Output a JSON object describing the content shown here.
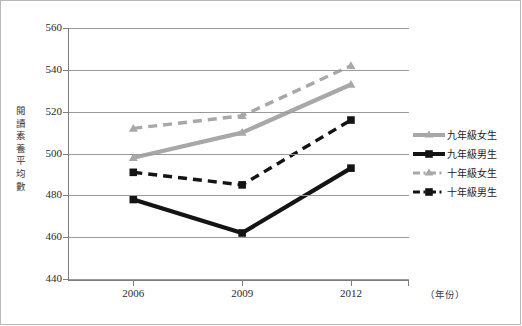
{
  "chart_data": {
    "type": "line",
    "title": "",
    "subtitle": "",
    "xlabel": "（年份）",
    "ylabel": "閱讀素養平均數",
    "categories": [
      "2006",
      "2009",
      "2012"
    ],
    "x": [
      2006,
      2009,
      2012
    ],
    "xlim": [
      2004.2,
      2013.6
    ],
    "ylim": [
      440,
      560
    ],
    "yticks": [
      440,
      460,
      480,
      500,
      520,
      540,
      560
    ],
    "grid": "horizontal",
    "legend_position": "right",
    "series": [
      {
        "name": "九年級女生",
        "values": [
          498,
          510,
          533
        ],
        "color": "#a8a8a8",
        "style": "solid",
        "marker": "triangle"
      },
      {
        "name": "九年級男生",
        "values": [
          478,
          462,
          493
        ],
        "color": "#141414",
        "style": "solid",
        "marker": "square"
      },
      {
        "name": "十年級女生",
        "values": [
          512,
          518,
          542
        ],
        "color": "#a8a8a8",
        "style": "dashed",
        "marker": "triangle"
      },
      {
        "name": "十年級男生",
        "values": [
          491,
          485,
          516
        ],
        "color": "#141414",
        "style": "dashed",
        "marker": "square"
      }
    ]
  },
  "axis": {
    "y_tick_labels": [
      "560",
      "540",
      "520",
      "500",
      "480",
      "460",
      "440"
    ],
    "y_title_chars": [
      "閱",
      "讀",
      "素",
      "養",
      "平",
      "均",
      "數"
    ],
    "x_tick_labels": [
      "2006",
      "2009",
      "2012"
    ],
    "x_title": "（年份）"
  },
  "legend": {
    "items": [
      {
        "label": "九年級女生"
      },
      {
        "label": "九年級男生"
      },
      {
        "label": "十年級女生"
      },
      {
        "label": "十年級男生"
      }
    ]
  },
  "colors": {
    "gray_series": "#a8a8a8",
    "black_series": "#141414",
    "gridline": "#9a9a9a",
    "axis": "#7d7d7d",
    "frame": "#b9b9b9",
    "text": "#2b2b2b"
  }
}
